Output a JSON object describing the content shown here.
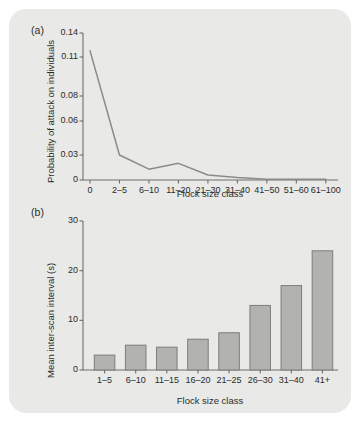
{
  "figure": {
    "background_color": "#e9e9e7",
    "page_color": "#ffffff",
    "axis_color": "#6e6e6e",
    "text_color": "#2b2b2b"
  },
  "panel_a": {
    "letter": "(a)",
    "ylabel": "Probability of attack on individuals",
    "xlabel": "Flock size class"
  },
  "panel_b": {
    "letter": "(b)",
    "ylabel": "Mean inter-scan interval (s)",
    "xlabel": "Flock size class"
  },
  "chart_data": [
    {
      "type": "line",
      "panel": "(a)",
      "title": "",
      "xlabel": "Flock size class",
      "ylabel": "Probability of attack on individuals",
      "categories": [
        "0",
        "2–5",
        "6–10",
        "11–20",
        "21–30",
        "31–40",
        "41–50",
        "51–60",
        "61–100"
      ],
      "values": [
        0.118,
        0.03,
        0.013,
        0.02,
        0.006,
        0.003,
        0.001,
        0.001,
        0.001
      ],
      "ytick_values": [
        0,
        0.03,
        0.06,
        0.08,
        0.11,
        0.14
      ],
      "ytick_labels": [
        "0",
        "0.03",
        "0.06",
        "0.08",
        "0.11",
        "0.14"
      ],
      "ylim": [
        0,
        0.14
      ],
      "grid": false,
      "legend": "none",
      "line_color": "#8a8a8a"
    },
    {
      "type": "bar",
      "panel": "(b)",
      "title": "",
      "xlabel": "Flock size class",
      "ylabel": "Mean inter-scan interval (s)",
      "categories": [
        "1–5",
        "6–10",
        "11–15",
        "16–20",
        "21–25",
        "26–30",
        "31–40",
        "41+"
      ],
      "values": [
        3.0,
        5.0,
        4.6,
        6.2,
        7.5,
        13.0,
        17.0,
        24.0
      ],
      "ytick_values": [
        0,
        10,
        20,
        30
      ],
      "ytick_labels": [
        "0",
        "10",
        "20",
        "30"
      ],
      "ylim": [
        0,
        30
      ],
      "grid": false,
      "legend": "none",
      "bar_fill": "#b2b2b0",
      "bar_stroke": "#7d7d7b"
    }
  ]
}
